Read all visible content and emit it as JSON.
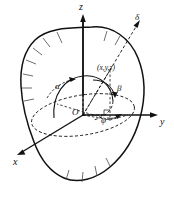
{
  "figure": {
    "kind": "3d-coordinate-diagram",
    "background_color": "#ffffff",
    "ink_color": "#111111",
    "axes": [
      {
        "id": "z",
        "label": "z",
        "direction": "up",
        "style": "solid-with-arrow"
      },
      {
        "id": "y",
        "label": "y",
        "direction": "right",
        "style": "solid-with-arrow"
      },
      {
        "id": "x",
        "label": "x",
        "direction": "lower-left",
        "style": "solid-with-arrow"
      }
    ],
    "origin": {
      "label": "O"
    },
    "point": {
      "label": "(x,y,z)"
    },
    "ray": {
      "label": "δ",
      "style": "dashed-with-arrow"
    },
    "angles": [
      {
        "id": "alpha",
        "label": "α",
        "measured_from": "x-axis"
      },
      {
        "id": "beta",
        "label": "β",
        "measured_from": "y-axis"
      },
      {
        "id": "phi",
        "label": "φ",
        "measured_from": "projection-in-xy-plane"
      }
    ],
    "body": {
      "name": "hatched-solid-outline",
      "boundary_style": "solid-with-hatch-ticks",
      "interior_curves": "dashed"
    }
  }
}
